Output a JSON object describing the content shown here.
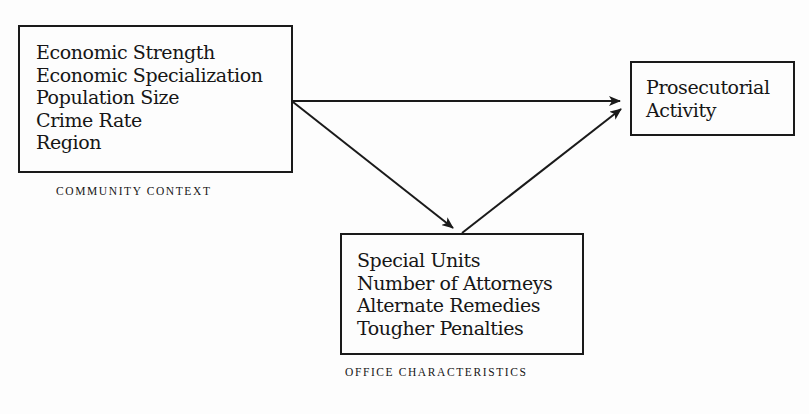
{
  "diagram": {
    "nodes": {
      "community": {
        "items": [
          "Economic Strength",
          "Economic Specialization",
          "Population Size",
          "Crime Rate",
          "Region"
        ],
        "caption": "COMMUNITY CONTEXT"
      },
      "outcome": {
        "items": [
          "Prosecutorial",
          "Activity"
        ]
      },
      "office": {
        "items": [
          "Special Units",
          "Number of Attorneys",
          "Alternate Remedies",
          "Tougher Penalties"
        ],
        "caption": "OFFICE CHARACTERISTICS"
      }
    },
    "edges": [
      {
        "from": "community",
        "to": "outcome"
      },
      {
        "from": "community",
        "to": "office"
      },
      {
        "from": "office",
        "to": "outcome"
      }
    ],
    "colors": {
      "line": "#1a1a1a",
      "text": "#161616",
      "background": "#fdfdfd"
    }
  }
}
